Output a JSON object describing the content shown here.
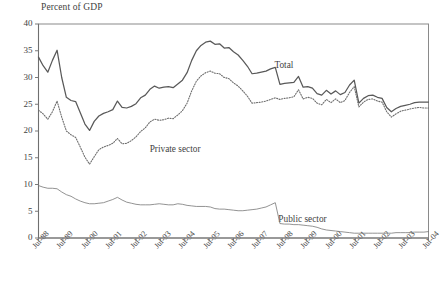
{
  "chart_data": {
    "type": "line",
    "title": "Percent of GDP",
    "xlabel": "",
    "ylabel": "Percent of GDP",
    "ylim": [
      0,
      40
    ],
    "yticks": [
      0,
      5,
      10,
      15,
      20,
      25,
      30,
      35,
      40
    ],
    "grid": false,
    "legend_position": "inline-annotations",
    "xtick_labels": [
      "Jul-88",
      "Jul-89",
      "Jul-90",
      "Jul-91",
      "Jul-92",
      "Jul-93",
      "Jul-94",
      "Jul-95",
      "Jul-96",
      "Jul-97",
      "Jul-98",
      "Jul-99",
      "Jul-00",
      "Jul-01",
      "Jul-02",
      "Jul-03",
      "Jul-04"
    ],
    "x_start": "Jul-88",
    "x_end": "Jul-04",
    "x_frequency": "quarterly",
    "annotations": [
      {
        "label": "Total",
        "series": "Total",
        "x_pos": 0.605,
        "y_value": 32.0
      },
      {
        "label": "Private sector",
        "series": "Private sector",
        "x_pos": 0.285,
        "y_value": 16.3
      },
      {
        "label": "Public sector",
        "series": "Public sector",
        "x_pos": 0.615,
        "y_value": 3.3
      }
    ],
    "series": [
      {
        "name": "Total",
        "style": "solid",
        "color": "#595959",
        "width": 1.25,
        "values": [
          33.8,
          32.2,
          31.0,
          33.2,
          35.1,
          30.0,
          26.3,
          25.7,
          25.5,
          23.4,
          21.3,
          20.1,
          21.8,
          22.8,
          23.3,
          23.6,
          24.0,
          25.6,
          24.4,
          24.3,
          24.6,
          25.1,
          26.2,
          26.7,
          27.8,
          28.4,
          28.0,
          28.2,
          28.3,
          28.1,
          28.8,
          29.5,
          30.9,
          33.2,
          35.0,
          36.0,
          36.6,
          36.8,
          36.2,
          36.3,
          35.5,
          35.6,
          34.8,
          34.2,
          33.2,
          32.1,
          30.7,
          30.8,
          31.0,
          31.2,
          31.6,
          31.9,
          28.7,
          28.9,
          29.0,
          29.1,
          30.2,
          28.2,
          28.3,
          28.0,
          27.0,
          26.7,
          27.6,
          26.9,
          27.5,
          26.8,
          27.2,
          28.6,
          29.5,
          25.2,
          26.1,
          26.6,
          26.7,
          26.3,
          26.1,
          24.4,
          23.6,
          24.2,
          24.6,
          24.8,
          25.0,
          25.3,
          25.4,
          25.4,
          25.4
        ]
      },
      {
        "name": "Private sector",
        "style": "dotted",
        "color": "#6e6e6e",
        "width": 1.1,
        "values": [
          23.9,
          23.2,
          22.2,
          23.6,
          25.6,
          22.6,
          20.0,
          19.3,
          18.8,
          17.0,
          15.1,
          13.8,
          15.2,
          16.5,
          17.0,
          17.3,
          17.7,
          18.6,
          17.6,
          17.7,
          18.2,
          18.9,
          19.9,
          20.6,
          21.7,
          22.2,
          22.0,
          22.1,
          22.4,
          22.3,
          23.0,
          23.8,
          25.2,
          27.5,
          29.3,
          30.3,
          30.9,
          31.2,
          30.8,
          30.7,
          30.0,
          29.8,
          29.0,
          28.4,
          27.5,
          26.5,
          25.2,
          25.3,
          25.4,
          25.6,
          25.9,
          26.2,
          25.9,
          26.1,
          26.2,
          26.4,
          27.7,
          26.0,
          26.3,
          26.1,
          25.2,
          24.9,
          25.9,
          25.3,
          26.0,
          25.3,
          25.7,
          27.2,
          28.3,
          24.5,
          25.4,
          25.9,
          26.0,
          25.6,
          25.4,
          23.6,
          22.6,
          23.2,
          23.7,
          23.9,
          24.1,
          24.3,
          24.4,
          24.3,
          24.3
        ]
      },
      {
        "name": "Public sector",
        "style": "solid",
        "color": "#777777",
        "width": 0.8,
        "values": [
          9.8,
          9.5,
          9.3,
          9.3,
          9.2,
          8.6,
          8.1,
          7.8,
          7.3,
          6.9,
          6.6,
          6.4,
          6.4,
          6.5,
          6.6,
          6.9,
          7.2,
          7.6,
          7.1,
          6.7,
          6.5,
          6.3,
          6.2,
          6.2,
          6.2,
          6.3,
          6.4,
          6.3,
          6.2,
          6.2,
          6.4,
          6.3,
          6.1,
          6.0,
          5.9,
          5.9,
          5.9,
          5.8,
          5.5,
          5.4,
          5.4,
          5.3,
          5.2,
          5.1,
          5.1,
          5.2,
          5.3,
          5.4,
          5.6,
          5.8,
          6.2,
          6.6,
          2.7,
          2.6,
          2.6,
          2.5,
          2.5,
          2.4,
          2.3,
          2.2,
          2.0,
          1.7,
          1.5,
          1.4,
          1.3,
          1.2,
          1.1,
          1.0,
          0.9,
          0.9,
          0.9,
          0.9,
          0.9,
          0.9,
          0.9,
          0.9,
          0.9,
          1.0,
          1.0,
          1.0,
          1.0,
          1.1,
          1.1,
          1.1,
          1.2
        ]
      }
    ]
  }
}
